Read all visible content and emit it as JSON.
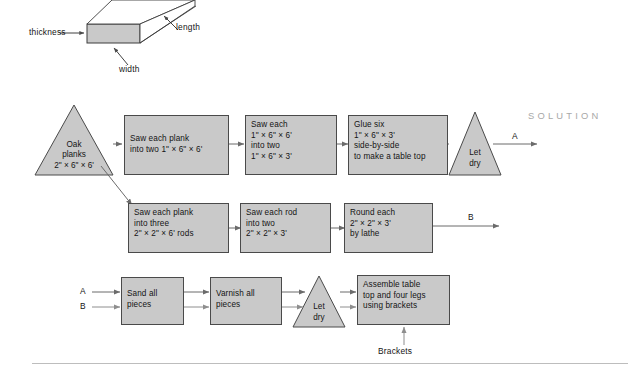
{
  "page": {
    "section_label": "SOLUTION",
    "background": "#ffffff",
    "node_fill": "#c9c9c9",
    "node_stroke": "#4a4a4a",
    "line_color": "#6b6b6b",
    "rule_color": "#bdbdbd"
  },
  "plank_diagram": {
    "name": "plank-dimensions-diagram",
    "labels": {
      "thickness": "thickness",
      "length": "length",
      "width": "width"
    }
  },
  "flowchart": {
    "row1": {
      "start_triangle": "Oak\nplanks\n2\" × 6\" × 6'",
      "step1": "Saw each plank\ninto two 1\" × 6\" × 6'",
      "step2": "Saw each\n1\" × 6\" × 6'\ninto two\n1\" × 6\" × 3'",
      "step3": "Glue six\n1\" × 6\" × 3'\nside-by-side\nto make a table top",
      "end_triangle": "Let\ndry",
      "output_label": "A"
    },
    "row2": {
      "step1": "Saw each plank\ninto three\n2\" × 2\" × 6' rods",
      "step2": "Saw each rod\ninto two\n2\" × 2\" × 3'",
      "step3": "Round each\n2\" × 2\" × 3'\nby lathe",
      "output_label": "B"
    },
    "row3": {
      "input_a": "A",
      "input_b": "B",
      "step1": "Sand all\npieces",
      "step2": "Varnish all\npieces",
      "triangle": "Let\ndry",
      "step3": "Assemble table\ntop and four legs\nusing brackets",
      "material_input": "Brackets"
    }
  }
}
